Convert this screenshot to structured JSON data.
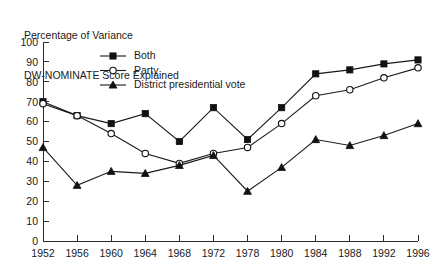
{
  "chart_data": {
    "type": "line",
    "title": "Percentage of Variance\nDW-NOMINATE Score Explained",
    "title_lines": [
      "Percentage of Variance",
      "DW-NOMINATE Score Explained"
    ],
    "xlabel": "",
    "ylabel": "",
    "categories": [
      "1952",
      "1956",
      "1960",
      "1964",
      "1968",
      "1972",
      "1978",
      "1980",
      "1984",
      "1988",
      "1992",
      "1996"
    ],
    "ylim": [
      0,
      100
    ],
    "ytick_labels": [
      "0",
      "10",
      "20",
      "30",
      "40",
      "50",
      "60",
      "70",
      "80",
      "90",
      "100"
    ],
    "ytick_values": [
      0,
      10,
      20,
      30,
      40,
      50,
      60,
      70,
      80,
      90,
      100
    ],
    "grid": false,
    "legend_position": "top-center",
    "series": [
      {
        "name": "Both",
        "marker": "filled-square",
        "values": [
          70,
          63,
          59,
          64,
          50,
          67,
          51,
          67,
          84,
          86,
          89,
          91
        ]
      },
      {
        "name": "Party",
        "marker": "open-circle",
        "values": [
          69,
          63,
          54,
          44,
          39,
          44,
          47,
          59,
          73,
          76,
          82,
          87
        ]
      },
      {
        "name": "District presidential vote",
        "marker": "filled-triangle",
        "values": [
          47,
          28,
          35,
          34,
          38,
          43,
          25,
          37,
          51,
          48,
          53,
          59
        ]
      }
    ],
    "colors": {
      "line": "#1a1a1a",
      "axis": "#2b2b2b",
      "background": "#ffffff",
      "marker_fill": "#111111",
      "marker_open_fill": "#ffffff"
    }
  }
}
